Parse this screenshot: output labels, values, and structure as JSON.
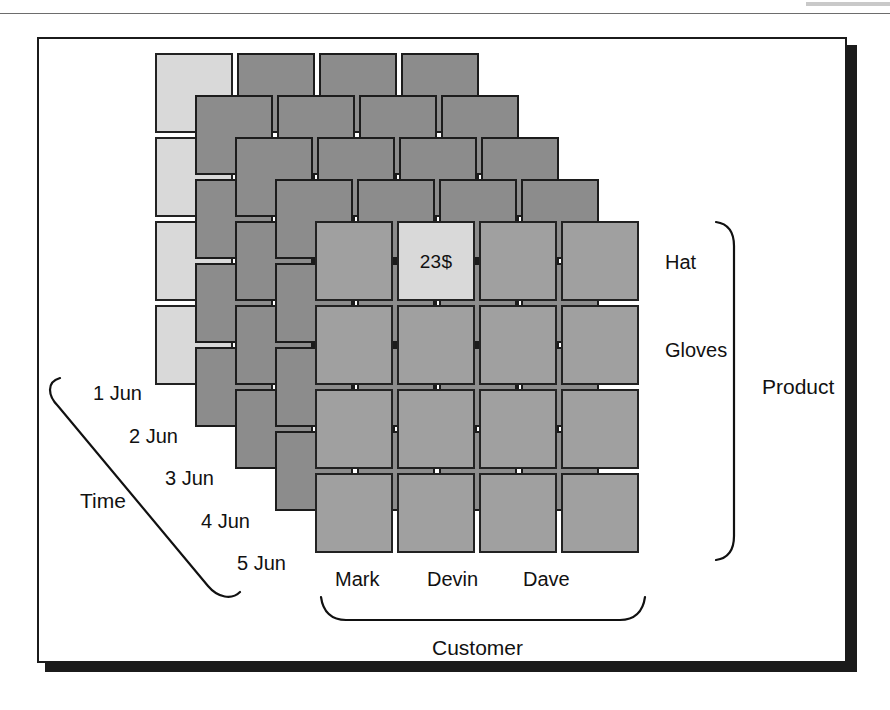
{
  "figure": {
    "kind": "three-dimensional data cube"
  },
  "colors": {
    "cell_front": "#a0a0a0",
    "cell_back": "#8c8c8c",
    "cell_highlight": "#d9d9d9",
    "outline": "#222222",
    "text": "#111111",
    "frame": "#1b1b1b",
    "shadow": "#1b1b1b"
  },
  "axes": {
    "time": {
      "name": "Time",
      "ticks": [
        "1 Jun",
        "2 Jun",
        "3 Jun",
        "4 Jun",
        "5 Jun"
      ]
    },
    "product": {
      "name": "Product",
      "ticks": [
        "Hat",
        "Gloves"
      ]
    },
    "customer": {
      "name": "Customer",
      "ticks": [
        "Mark",
        "Devin",
        "Dave"
      ]
    }
  },
  "cube": {
    "layers": 5,
    "rows": 4,
    "cols": 4,
    "cell_width": 78,
    "cell_height": 80,
    "gap_x": 4,
    "gap_y": 4,
    "layer_offset_x": 40,
    "layer_offset_y": 42,
    "origin_x": 155,
    "origin_y": 53,
    "highlight_cell": {
      "layer": 4,
      "row": 0,
      "col": 1,
      "value": "23$"
    },
    "highlight_slice": {
      "layer": 0,
      "col": 0,
      "description": "leftmost column of back layer highlighted"
    }
  }
}
